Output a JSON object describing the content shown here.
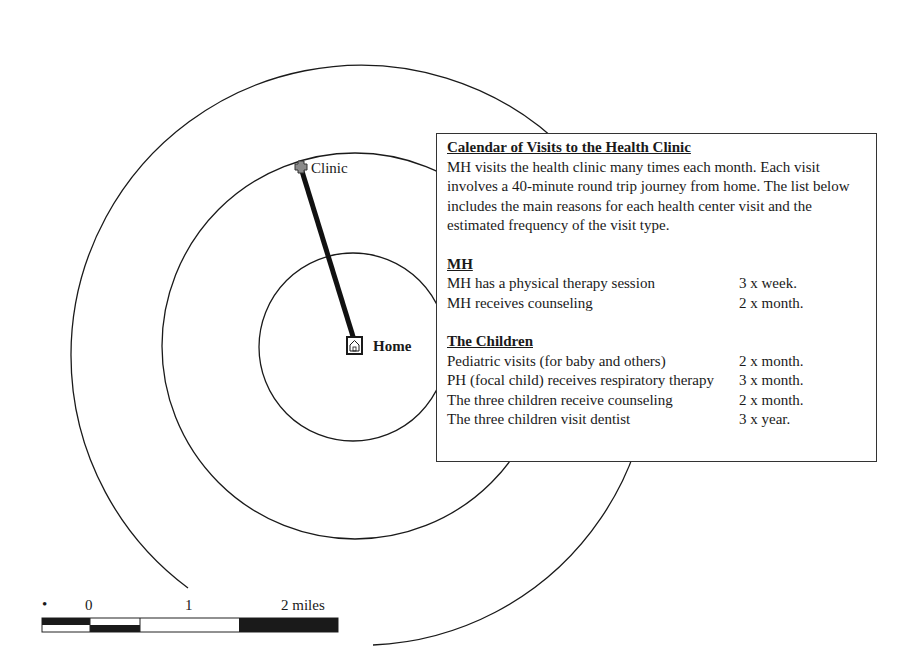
{
  "map": {
    "clinic_label": "Clinic",
    "home_label": "Home",
    "clinic_icon": "cross-icon",
    "home_icon": "house-icon",
    "center": [
      355,
      344
    ],
    "ring_radii_px": [
      94,
      193,
      290
    ],
    "colors": {
      "line": "#1a1a1a",
      "route": "#111111"
    }
  },
  "info": {
    "title": "Calendar of Visits to the Health Clinic",
    "intro": "MH visits the health clinic many times each month. Each visit involves a 40-minute round trip journey from home. The list below includes the main reasons for each health center visit and the estimated frequency of the visit type.",
    "sections": [
      {
        "title": "MH",
        "rows": [
          {
            "reason": "MH has a physical therapy session",
            "frequency": "3 x week."
          },
          {
            "reason": "MH receives counseling",
            "frequency": "2 x month."
          }
        ]
      },
      {
        "title": "The Children",
        "rows": [
          {
            "reason": "Pediatric visits (for baby and others)",
            "frequency": "2 x month."
          },
          {
            "reason": "PH (focal child) receives respiratory therapy",
            "frequency": "3 x month."
          },
          {
            "reason": "The three children receive counseling",
            "frequency": "2 x month."
          },
          {
            "reason": "The three children visit dentist",
            "frequency": "3 x year."
          }
        ]
      }
    ]
  },
  "scale": {
    "dot": "•",
    "labels": [
      "0",
      "1",
      "2 miles"
    ]
  }
}
